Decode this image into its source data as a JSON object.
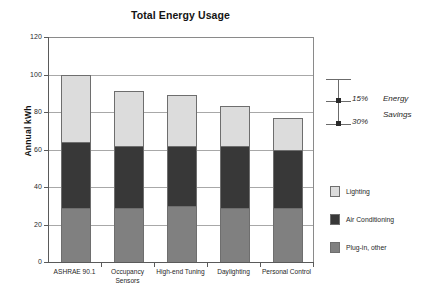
{
  "chart_data": {
    "type": "bar",
    "subtype": "stacked-column",
    "title": "Total Energy Usage",
    "xlabel": "",
    "ylabel": "Annual kWh",
    "ylim": [
      0,
      120
    ],
    "yticks": [
      0,
      20,
      40,
      60,
      80,
      100,
      120
    ],
    "grid": true,
    "legend_position": "right",
    "categories": [
      "ASHRAE 90.1",
      "Occupancy Sensors",
      "High-end Tuning",
      "Daylighting",
      "Personal Control"
    ],
    "category_lines": [
      [
        "ASHRAE 90.1"
      ],
      [
        "Occupancy",
        "Sensors"
      ],
      [
        "High-end Tuning"
      ],
      [
        "Daylighting"
      ],
      [
        "Personal Control"
      ]
    ],
    "series": [
      {
        "name": "Plug-in, other",
        "color": "#808080",
        "values": [
          29,
          29,
          30,
          29,
          29
        ]
      },
      {
        "name": "Air Conditioning",
        "color": "#383838",
        "values": [
          35,
          33,
          32,
          33,
          31
        ]
      },
      {
        "name": "Lighting",
        "color": "#dcdcdc",
        "values": [
          36,
          29,
          27,
          21,
          17
        ]
      }
    ],
    "totals": [
      100,
      91,
      89,
      83,
      77
    ],
    "annotations": {
      "label_lines": [
        "Energy",
        "Savings"
      ],
      "markers": [
        {
          "label": "15%",
          "value": 15
        },
        {
          "label": "30%",
          "value": 30
        }
      ]
    }
  },
  "legend": {
    "entries": [
      {
        "label": "Lighting",
        "color": "#dcdcdc"
      },
      {
        "label": "Air Conditioning",
        "color": "#383838"
      },
      {
        "label": "Plug-in, other",
        "color": "#808080"
      }
    ]
  }
}
